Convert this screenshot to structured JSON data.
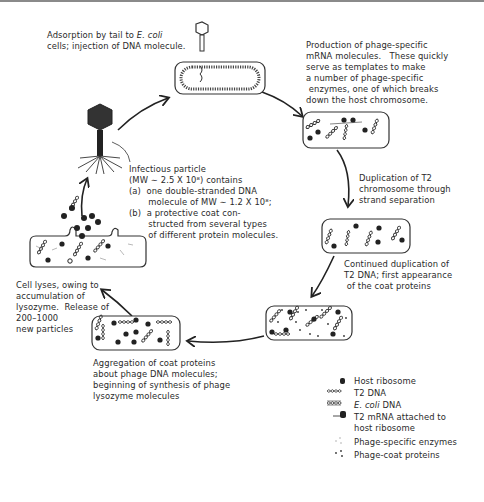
{
  "steps": {
    "adsorption": {
      "line1_prefix": "Adsorption by tail to ",
      "line1_italic": "E. coli",
      "line2": "cells; injection of DNA molecule."
    },
    "mrna": {
      "lines": [
        "Production of phage-specific",
        "mRNA molecules.   These quickly",
        "serve as templates to make",
        "a number of phage-specific",
        " enzymes, one of which breaks",
        "down the host chromosome."
      ]
    },
    "duplication": {
      "lines": [
        "Duplication of T2",
        "chromosome through",
        "strand separation"
      ]
    },
    "continued": {
      "lines": [
        "Continued duplication of",
        "T2 DNA; first appearance",
        " of the coat proteins"
      ]
    },
    "aggregation": {
      "lines": [
        "Aggregation of coat proteins",
        "about phage DNA molecules;",
        "beginning of synthesis of phage",
        "lysozyme molecules"
      ]
    },
    "lysis": {
      "lines": [
        "Cell lyses, owing to",
        "accumulation of",
        "lysozyme.  Release of",
        "200–1000",
        "new particles"
      ]
    },
    "infectious": {
      "lines": [
        "Infectious particle",
        "(MW ∼ 2.5 X 10⁸) contains",
        "(a)  one double-stranded DNA",
        "       molecule of MW ∼ 1.2 X 10⁸;",
        "(b)  a protective coat con-",
        "       structed from several types",
        "       of different protein molecules."
      ]
    }
  },
  "legend": {
    "items": [
      {
        "icon": "host-ribosome-icon",
        "label": "Host ribosome"
      },
      {
        "icon": "t2-dna-icon",
        "label": "T2 DNA"
      },
      {
        "icon": "ecoli-dna-icon",
        "label_italic": "E. coli",
        "label_rest": " DNA"
      },
      {
        "icon": "t2-mrna-ribosome-icon",
        "label": "T2 mRNA attached to",
        "label2": "host ribosome"
      },
      {
        "icon": "phage-enzymes-icon",
        "label": "Phage-specific enzymes"
      },
      {
        "icon": "phage-coat-icon",
        "label": "Phage-coat proteins"
      }
    ]
  },
  "colors": {
    "ink": "#222222",
    "phage": "#333333",
    "cell_stroke": "#444444",
    "dots": "#999999"
  }
}
